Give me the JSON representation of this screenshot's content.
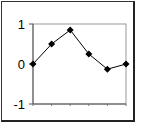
{
  "chart_data": {
    "type": "line",
    "title": "",
    "xlabel": "",
    "ylabel": "",
    "x": [
      1,
      2,
      3,
      4,
      5,
      6
    ],
    "series": [
      {
        "name": "Series 1",
        "values": [
          0,
          0.5,
          0.85,
          0.25,
          -0.13,
          0
        ],
        "color": "#000000",
        "marker": "diamond"
      }
    ],
    "ylim": [
      -1,
      1
    ],
    "yticks": [
      1,
      0,
      -1
    ],
    "ytick_labels": [
      "1",
      "0",
      "-1"
    ],
    "grid": false,
    "legend": "none"
  }
}
